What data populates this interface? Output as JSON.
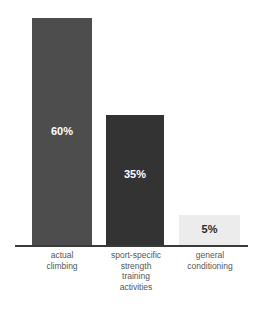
{
  "chart_data": {
    "type": "bar",
    "title": "",
    "subtitle": "",
    "xlabel": "",
    "ylabel": "",
    "ylim": [
      0,
      100
    ],
    "grid": false,
    "legend": "none",
    "orientation": "vertical",
    "background_color": "#ffffff",
    "axis_line_color": "#3a3a3a",
    "categories": [
      "actual\nclimbing",
      "sport-specific\nstrength\ntraining\nactivities",
      "general\nconditioning"
    ],
    "values": [
      60,
      35,
      5
    ],
    "value_labels": [
      "60%",
      "35%",
      "5%"
    ],
    "bars": [
      {
        "category": "actual\nclimbing",
        "value": 60,
        "value_label": "60%",
        "fill_color": "#4d4d4d",
        "label_color": "#ffffff",
        "left_px": 32,
        "width_px": 60,
        "height_px": 228
      },
      {
        "category": "sport-specific\nstrength\ntraining\nactivities",
        "value": 35,
        "value_label": "35%",
        "fill_color": "#333333",
        "label_color": "#ffffff",
        "left_px": 106,
        "width_px": 58,
        "height_px": 131
      },
      {
        "category": "general\nconditioning",
        "value": 5,
        "value_label": "5%",
        "fill_color": "#ececec",
        "label_color": "#2b2b2b",
        "left_px": 179,
        "width_px": 61,
        "height_px": 31
      }
    ],
    "category_label_color": "#565656"
  }
}
